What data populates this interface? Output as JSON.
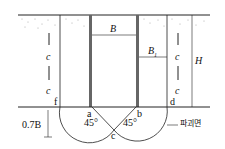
{
  "diagram": {
    "labels": {
      "width_B": "B",
      "width_B1": "B",
      "width_B1_sub": "1",
      "height_H": "H",
      "cohesion_c": "c",
      "depth_07B": "0.7B",
      "point_a": "a",
      "point_b": "b",
      "point_c": "c",
      "point_d": "d",
      "point_f": "f",
      "angle_left": "45°",
      "angle_right": "45°",
      "failure_surface": "파괴면"
    },
    "colors": {
      "line": "#222222",
      "wall": "#666666",
      "soil_dots": "#999999"
    }
  }
}
